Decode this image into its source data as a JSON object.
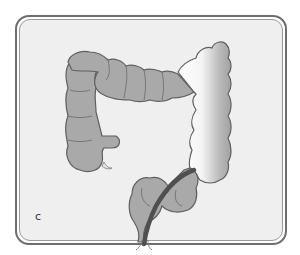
{
  "figure": {
    "panel_label": "c",
    "colors": {
      "background": "#ffffff",
      "frame_border": "#6e6e6e",
      "frame_inner_border": "#9a9a9a",
      "panel_fill": "#efefef",
      "colon_fill": "#a9a9a9",
      "colon_outline": "#5f5f5f",
      "highlighted_segment_light": "#ffffff",
      "highlighted_segment_dark": "#9c9c9c",
      "tube": "#4f4f4f"
    },
    "parts": [
      {
        "name": "ascending-colon"
      },
      {
        "name": "transverse-colon"
      },
      {
        "name": "descending-colon",
        "highlighted": true
      },
      {
        "name": "sigmoid-colon"
      },
      {
        "name": "tube"
      },
      {
        "name": "appendix"
      }
    ]
  }
}
